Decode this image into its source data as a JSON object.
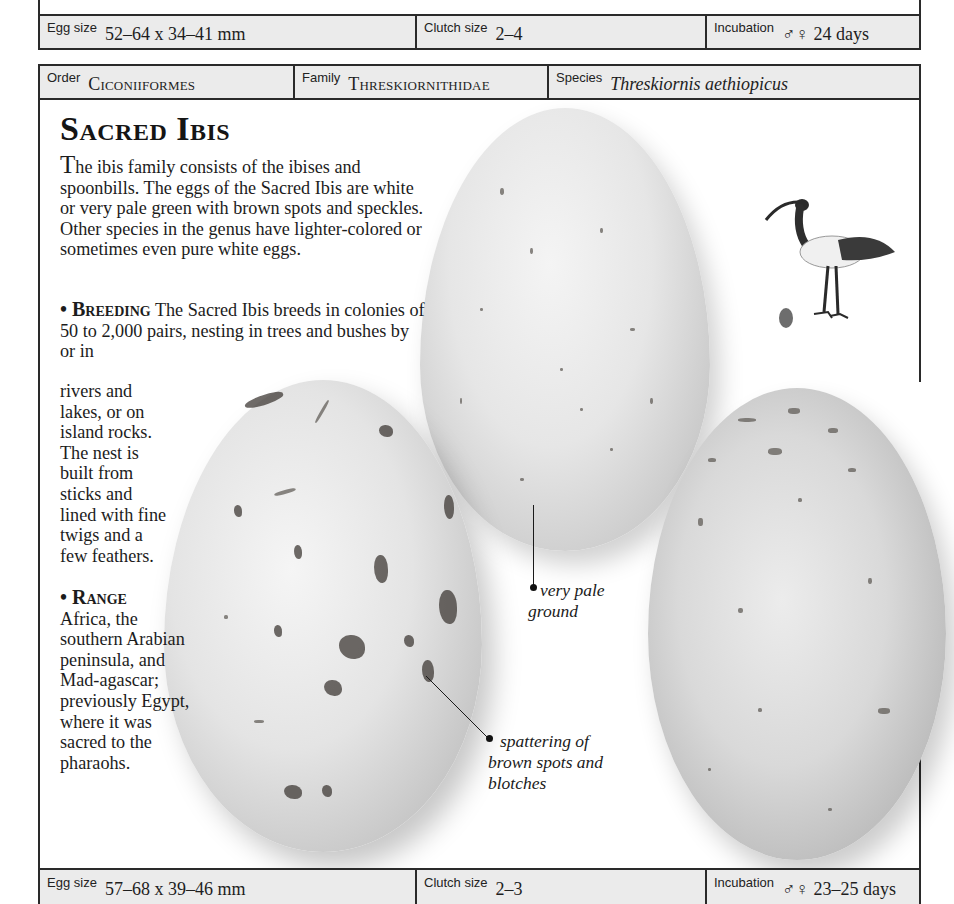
{
  "previous_entry": {
    "egg_size": {
      "label": "Egg size",
      "value": "52–64 x 34–41 mm"
    },
    "clutch_size": {
      "label": "Clutch size",
      "value": "2–4"
    },
    "incubation": {
      "label": "Incubation",
      "value": "♂♀ 24 days"
    }
  },
  "taxonomy": {
    "order": {
      "label": "Order",
      "value": "Ciconiiformes"
    },
    "family": {
      "label": "Family",
      "value": "Threskiornithidae"
    },
    "species": {
      "label": "Species",
      "value": "Threskiornis aethiopicus"
    }
  },
  "entry": {
    "title": "Sacred Ibis",
    "intro_dropcap": "T",
    "intro": "he ibis family consists of the ibises and spoonbills. The eggs of the Sacred Ibis are white or very pale green with brown spots and speckles. Other species in the genus have lighter-colored or sometimes even pure white eggs.",
    "breeding_head": "• Breeding",
    "breeding_wide": " The Sacred Ibis breeds in colonies of 50 to 2,000 pairs, nesting in trees and bushes by or in",
    "breeding_narrow": "rivers and lakes, or on island rocks. The nest is built from sticks and lined with fine twigs and a few feathers.",
    "range_head": "• Range",
    "range": "Africa, the southern Arabian peninsula, and Mad-agascar; previously Egypt, where it was sacred to the pharaohs."
  },
  "annotations": {
    "pale_ground": "very pale ground",
    "spots": "spattering of brown spots and blotches"
  },
  "icons": {
    "bird_illustration": "sacred-ibis-illustration",
    "egg_scale": "egg-scale-icon"
  },
  "current_entry": {
    "egg_size": {
      "label": "Egg size",
      "value": "57–68 x 39–46 mm"
    },
    "clutch_size": {
      "label": "Clutch size",
      "value": "2–3"
    },
    "incubation": {
      "label": "Incubation",
      "value": "♂♀ 23–25 days"
    }
  },
  "colors": {
    "bar_fill": "#ebebeb",
    "rule": "#2a2a2a",
    "text": "#1c1c1c"
  }
}
